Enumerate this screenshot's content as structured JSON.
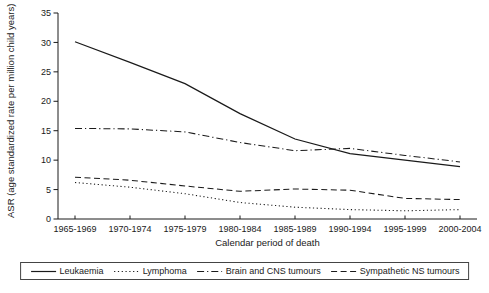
{
  "chart_data": {
    "type": "line",
    "title": "",
    "xlabel": "Calendar period of death",
    "ylabel": "ASR (age standardized rate per million child years)",
    "categories": [
      "1965-1969",
      "1970-1974",
      "1975-1979",
      "1980-1984",
      "1985-1989",
      "1990-1994",
      "1995-1999",
      "2000-2004"
    ],
    "series": [
      {
        "name": "Leukaemia",
        "line_style": "solid",
        "values": [
          30.1,
          26.6,
          23.0,
          17.9,
          13.6,
          11.1,
          10.0,
          8.9
        ]
      },
      {
        "name": "Lymphoma",
        "line_style": "dotted",
        "values": [
          6.2,
          5.4,
          4.3,
          2.8,
          2.0,
          1.6,
          1.4,
          1.6
        ]
      },
      {
        "name": "Brain and CNS tumours",
        "line_style": "dash-dot",
        "values": [
          15.4,
          15.3,
          14.8,
          13.0,
          11.6,
          12.0,
          10.8,
          9.7
        ]
      },
      {
        "name": "Sympathetic NS tumours",
        "line_style": "dashed",
        "values": [
          7.1,
          6.6,
          5.6,
          4.7,
          5.1,
          4.9,
          3.5,
          3.3
        ]
      }
    ],
    "ylim": [
      0,
      35
    ],
    "yticks": [
      0,
      5,
      10,
      15,
      20,
      25,
      30,
      35
    ],
    "grid": false,
    "legend_position": "bottom",
    "line_color": "#1a1a1a"
  }
}
